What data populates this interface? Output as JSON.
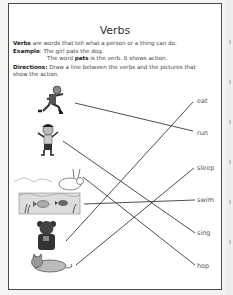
{
  "worksheet": {
    "title": "Verbs",
    "definition_term": "Verbs",
    "definition_rest": " are words that tell what a person or a thing can do.",
    "example_label": "Example",
    "example_sentence": ": The girl pats the dog.",
    "example_expl_pre": "The word ",
    "example_expl_bold": "pats",
    "example_expl_post": " is the verb. It shows action.",
    "directions_label": "Directions:",
    "directions_text_1": " Draw a line between the verbs and the pictures that",
    "directions_text_2": "show the action."
  },
  "pictures": [
    {
      "name": "running-boy",
      "y": 100
    },
    {
      "name": "singing-girl",
      "y": 140
    },
    {
      "name": "hopping-rabbit",
      "y": 175
    },
    {
      "name": "swimming-fish",
      "y": 200
    },
    {
      "name": "eating-bear",
      "y": 238
    },
    {
      "name": "sleeping-cat",
      "y": 265
    }
  ],
  "verbs": [
    {
      "label": "eat",
      "y": 101
    },
    {
      "label": "run",
      "y": 133
    },
    {
      "label": "sleep",
      "y": 168
    },
    {
      "label": "swim",
      "y": 200
    },
    {
      "label": "sing",
      "y": 233
    },
    {
      "label": "hop",
      "y": 266
    }
  ],
  "colors": {
    "line": "#3a3a3a",
    "border": "#4a4a4a"
  }
}
